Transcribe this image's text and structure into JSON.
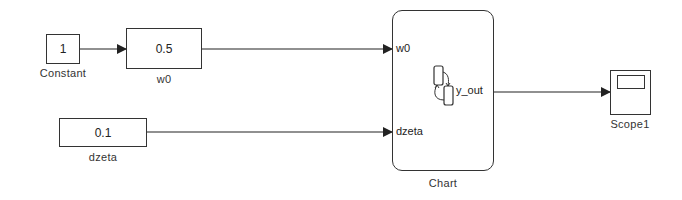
{
  "diagram": {
    "colors": {
      "line": "#222222",
      "block_border": "#333333",
      "background": "#ffffff"
    },
    "blocks": {
      "constant": {
        "value": "1",
        "label": "Constant",
        "type": "constant"
      },
      "w0": {
        "value": "0.5",
        "label": "w0",
        "type": "constant"
      },
      "dzeta": {
        "value": "0.1",
        "label": "dzeta",
        "type": "constant"
      },
      "chart": {
        "label": "Chart",
        "type": "stateflow-chart",
        "inputs": [
          "w0",
          "dzeta"
        ],
        "outputs": [
          "y_out"
        ]
      },
      "scope": {
        "label": "Scope1",
        "type": "scope"
      }
    },
    "connections": [
      {
        "from": "Constant",
        "to": "w0"
      },
      {
        "from": "w0",
        "to": "Chart.w0"
      },
      {
        "from": "dzeta",
        "to": "Chart.dzeta"
      },
      {
        "from": "Chart.y_out",
        "to": "Scope1"
      }
    ]
  }
}
